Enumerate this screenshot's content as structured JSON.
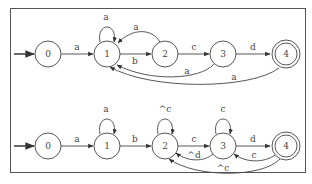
{
  "diagrams": [
    {
      "name": "dfa-top",
      "states": [
        {
          "id": "0",
          "label": "0",
          "accepting": false,
          "initial": true
        },
        {
          "id": "1",
          "label": "1",
          "accepting": false
        },
        {
          "id": "2",
          "label": "2",
          "accepting": false
        },
        {
          "id": "3",
          "label": "3",
          "accepting": false
        },
        {
          "id": "4",
          "label": "4",
          "accepting": true
        }
      ],
      "transitions": [
        {
          "from": "0",
          "to": "1",
          "label": "a"
        },
        {
          "from": "1",
          "to": "1",
          "label": "a"
        },
        {
          "from": "1",
          "to": "2",
          "label": "b"
        },
        {
          "from": "2",
          "to": "1",
          "label": "a"
        },
        {
          "from": "2",
          "to": "3",
          "label": "c"
        },
        {
          "from": "3",
          "to": "1",
          "label": "a"
        },
        {
          "from": "3",
          "to": "4",
          "label": "d"
        },
        {
          "from": "4",
          "to": "1",
          "label": "a"
        }
      ]
    },
    {
      "name": "dfa-bottom",
      "states": [
        {
          "id": "0",
          "label": "0",
          "accepting": false,
          "initial": true
        },
        {
          "id": "1",
          "label": "1",
          "accepting": false
        },
        {
          "id": "2",
          "label": "2",
          "accepting": false
        },
        {
          "id": "3",
          "label": "3",
          "accepting": false
        },
        {
          "id": "4",
          "label": "4",
          "accepting": true
        }
      ],
      "transitions": [
        {
          "from": "0",
          "to": "1",
          "label": "a"
        },
        {
          "from": "1",
          "to": "1",
          "label": "a"
        },
        {
          "from": "1",
          "to": "2",
          "label": "b"
        },
        {
          "from": "2",
          "to": "2",
          "label": "^c"
        },
        {
          "from": "2",
          "to": "3",
          "label": "c"
        },
        {
          "from": "3",
          "to": "3",
          "label": "c"
        },
        {
          "from": "3",
          "to": "2",
          "label": "^d"
        },
        {
          "from": "3",
          "to": "4",
          "label": "d"
        },
        {
          "from": "4",
          "to": "3",
          "label": "c"
        },
        {
          "from": "4",
          "to": "2",
          "label": "^c"
        }
      ]
    }
  ]
}
